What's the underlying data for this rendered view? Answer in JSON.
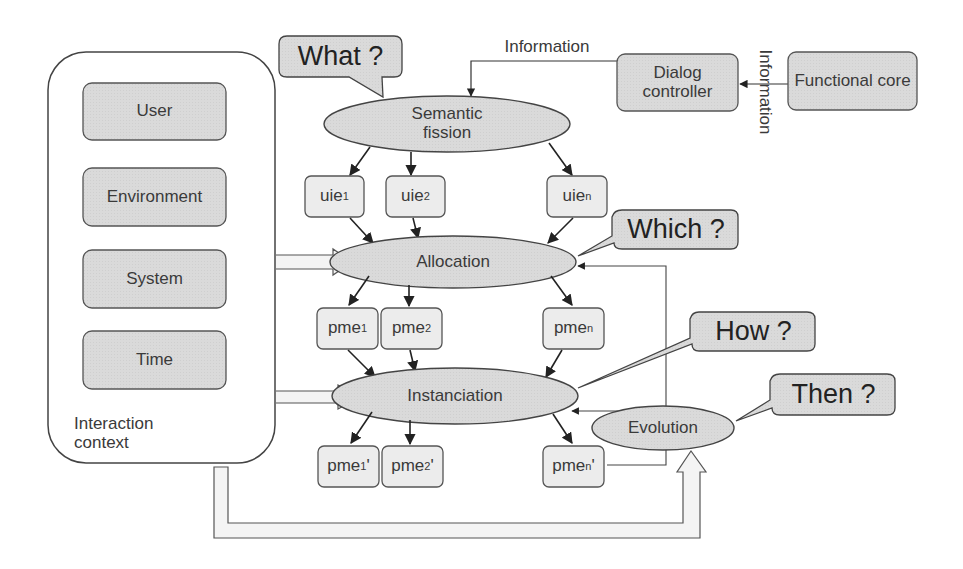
{
  "diagram": {
    "context": {
      "title_line1": "Interaction",
      "title_line2": "context",
      "items": [
        {
          "label": "User"
        },
        {
          "label": "Environment"
        },
        {
          "label": "System"
        },
        {
          "label": "Time"
        }
      ]
    },
    "callouts": {
      "what": "What ?",
      "which": "Which ?",
      "how": "How ?",
      "then": "Then ?"
    },
    "processes": {
      "semantic_fission_line1": "Semantic",
      "semantic_fission_line2": "fission",
      "allocation": "Allocation",
      "instanciation": "Instanciation",
      "evolution": "Evolution"
    },
    "external": {
      "dialog_controller_line1": "Dialog",
      "dialog_controller_line2": "controller",
      "functional_core": "Functional core",
      "information_top": "Information",
      "information_vertical": "Information"
    },
    "uie": [
      {
        "base": "uie",
        "sub": "1",
        "prime": ""
      },
      {
        "base": "uie",
        "sub": "2",
        "prime": ""
      },
      {
        "base": "uie",
        "sub": "n",
        "prime": ""
      }
    ],
    "pme": [
      {
        "base": "pme",
        "sub": "1",
        "prime": ""
      },
      {
        "base": "pme",
        "sub": "2",
        "prime": ""
      },
      {
        "base": "pme",
        "sub": "n",
        "prime": ""
      }
    ],
    "pme_prime": [
      {
        "base": "pme",
        "sub": "1",
        "prime": "'"
      },
      {
        "base": "pme",
        "sub": "2",
        "prime": "'"
      },
      {
        "base": "pme",
        "sub": "n",
        "prime": "'"
      }
    ],
    "colors": {
      "fill": "#dcdcdc",
      "stroke": "#444444",
      "line": "#333333"
    }
  }
}
